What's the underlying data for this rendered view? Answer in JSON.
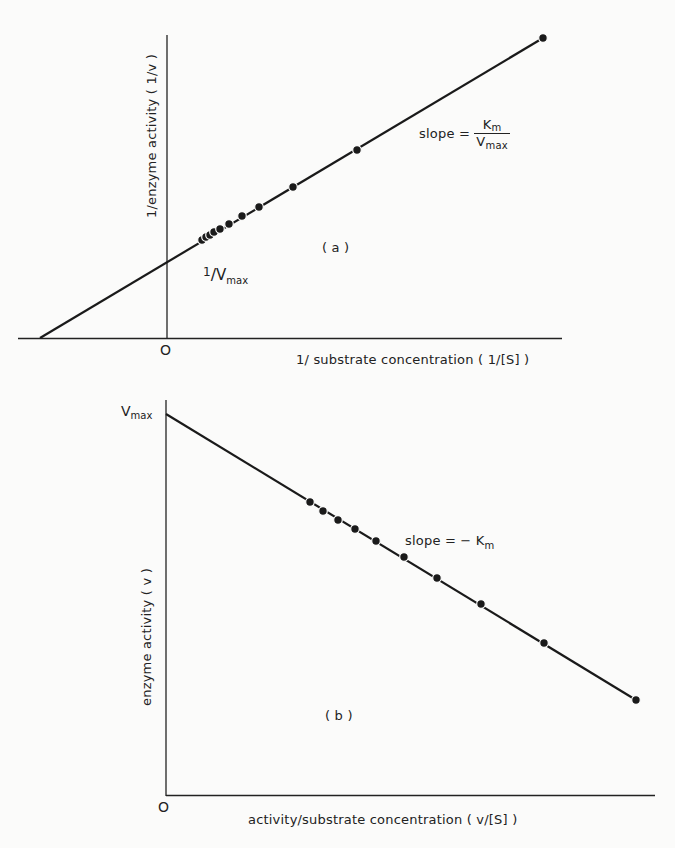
{
  "figure": {
    "panel_a": {
      "label": "( a )",
      "ylabel": "1/enzyme activity ( 1/v )",
      "xlabel": "1/ substrate concentration ( 1/[S] )",
      "origin": "O",
      "intercept_label_num": "1",
      "intercept_label_den": "V",
      "intercept_label_sub": "max",
      "slope_prefix": "slope =",
      "slope_num": "K",
      "slope_num_sub": "m",
      "slope_den": "V",
      "slope_den_sub": "max"
    },
    "panel_b": {
      "label": "( b )",
      "ylabel": "enzyme activity ( v )",
      "xlabel": "activity/substrate concentration ( v/[S] )",
      "origin": "O",
      "intercept_label": "V",
      "intercept_label_sub": "max",
      "slope_text": "slope = − K",
      "slope_sub": "m"
    }
  },
  "chart_data": [
    {
      "type": "scatter",
      "title": "(a) Lineweaver-Burk plot",
      "xlabel": "1/ substrate concentration (1/[S])",
      "ylabel": "1/enzyme activity (1/v)",
      "grid": false,
      "legend": null,
      "annotations": [
        "1/Vmax (y-intercept)",
        "slope = Km/Vmax",
        "O (origin)"
      ],
      "xlim": [
        -0.34,
        1.0
      ],
      "ylim": [
        0,
        1.0
      ],
      "fit_line": {
        "x_intercept": -0.34,
        "y_intercept": 0.25,
        "x_end": 1.0,
        "y_end": 1.0
      },
      "x": [
        0.09,
        0.1,
        0.11,
        0.12,
        0.14,
        0.16,
        0.2,
        0.24,
        0.33,
        0.5,
        1.0
      ],
      "y": [
        0.3,
        0.31,
        0.32,
        0.33,
        0.34,
        0.36,
        0.38,
        0.41,
        0.48,
        0.61,
        1.0
      ]
    },
    {
      "type": "scatter",
      "title": "(b) Eadie-Hofstee plot",
      "xlabel": "activity/substrate concentration (v/[S])",
      "ylabel": "enzyme activity (v)",
      "grid": false,
      "legend": null,
      "annotations": [
        "Vmax (y-intercept)",
        "slope = -Km",
        "O (origin)"
      ],
      "xlim": [
        0,
        1.0
      ],
      "ylim": [
        0,
        1.0
      ],
      "fit_line": {
        "y_intercept": 0.96,
        "x_end": 0.96,
        "y_end": 0.24
      },
      "x": [
        0.3,
        0.32,
        0.35,
        0.39,
        0.43,
        0.49,
        0.56,
        0.65,
        0.78,
        0.96
      ],
      "y": [
        0.74,
        0.72,
        0.7,
        0.67,
        0.64,
        0.6,
        0.55,
        0.48,
        0.38,
        0.24
      ]
    }
  ],
  "pixel_points": {
    "a": [
      [
        202,
        240
      ],
      [
        206,
        237
      ],
      [
        210,
        235
      ],
      [
        214,
        232
      ],
      [
        220,
        229
      ],
      [
        229,
        224
      ],
      [
        242,
        216
      ],
      [
        259,
        207
      ],
      [
        293,
        187
      ],
      [
        357,
        150
      ],
      [
        543,
        38
      ]
    ],
    "b": [
      [
        310,
        502
      ],
      [
        323,
        511
      ],
      [
        338,
        520
      ],
      [
        355,
        529
      ],
      [
        376,
        541
      ],
      [
        404,
        557
      ],
      [
        437,
        578
      ],
      [
        481,
        604
      ],
      [
        544,
        643
      ],
      [
        636,
        700
      ]
    ]
  }
}
